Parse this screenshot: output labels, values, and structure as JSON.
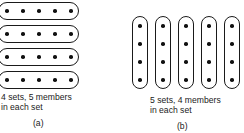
{
  "panel_a": {
    "sets": 4,
    "members_per_set": 5,
    "orientation": "horizontal",
    "caption_line1": "4 sets, 5 members",
    "caption_line2": "in each set",
    "label": "(a)"
  },
  "panel_b": {
    "sets": 5,
    "members_per_set": 4,
    "orientation": "vertical",
    "caption_line1": "5 sets, 4 members",
    "caption_line2": "in each set",
    "label": "(b)"
  },
  "colors": {
    "stroke": "#1a1a1a",
    "dot": "#111111",
    "background": "#ffffff"
  }
}
